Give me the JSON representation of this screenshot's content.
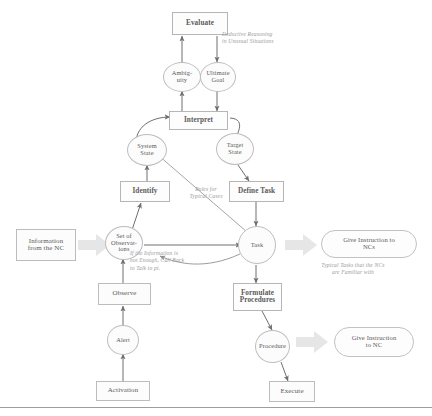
{
  "figure": {
    "colors": {
      "node_stroke": "#bdbdbd",
      "node_fill": "#fcfcfc",
      "text": "#5a5a5a",
      "caption_text": "#9a9a9a",
      "thin_arrow": "#6f6f6f",
      "block_arrow": "#e2e2e2",
      "rule": "#9d9d9d"
    }
  },
  "nodes": {
    "evaluate": {
      "label": "Evaluate",
      "shape": "box"
    },
    "ambiguity": {
      "label": "Ambig-\nuity",
      "shape": "circle"
    },
    "ultimate_goal": {
      "label": "Ultimate\nGoal",
      "shape": "circle"
    },
    "interpret": {
      "label": "Interpret",
      "shape": "box"
    },
    "system_state": {
      "label": "System\nState",
      "shape": "circle"
    },
    "target_state": {
      "label": "Target\nState",
      "shape": "circle"
    },
    "identify": {
      "label": "Identify",
      "shape": "box"
    },
    "define_task": {
      "label": "Define Task",
      "shape": "box"
    },
    "information_from_nc": {
      "label": "Information\nfrom the NC",
      "shape": "plainbox"
    },
    "set_of_observations": {
      "label": "Set of\nObservat-\nions",
      "shape": "circle"
    },
    "task": {
      "label": "Task",
      "shape": "circle"
    },
    "give_instruction_to_ncs": {
      "label": "Give Instruction to\nNCs",
      "shape": "pill"
    },
    "observe": {
      "label": "Observe",
      "shape": "plainbox"
    },
    "formulate_procedures": {
      "label": "Formulate\nProcedures",
      "shape": "box"
    },
    "alert": {
      "label": "Alert",
      "shape": "circle"
    },
    "procedure": {
      "label": "Procedure",
      "shape": "circle"
    },
    "give_instruction_to_nc": {
      "label": "Give Instruction\nto NC",
      "shape": "pill"
    },
    "activation": {
      "label": "Activation",
      "shape": "plainbox"
    },
    "execute": {
      "label": "Execute",
      "shape": "plainbox"
    }
  },
  "captions": {
    "deductive_reasoning": "Deductive Reasoning\nin Unusual Situations",
    "rules_for_typical_cases": "Rules for\nTypical Cases",
    "call_back": "If the Information is\nnot Enough, Call Back\nto Talk to pt.",
    "typical_tasks": "Typical Tasks that the NCs\nare Familiar with"
  },
  "edges": [
    {
      "from": "ambiguity",
      "to": "evaluate",
      "style": "thin-arrow"
    },
    {
      "from": "evaluate",
      "to": "ultimate_goal",
      "style": "thin-arrow"
    },
    {
      "from": "interpret",
      "to": "ambiguity",
      "style": "thin-arrow"
    },
    {
      "from": "ultimate_goal",
      "to": "interpret",
      "style": "thin-arrow"
    },
    {
      "from": "system_state",
      "to": "interpret",
      "style": "curved-arrow"
    },
    {
      "from": "interpret",
      "to": "target_state",
      "style": "curved-arrow"
    },
    {
      "from": "identify",
      "to": "system_state",
      "style": "thin-arrow"
    },
    {
      "from": "target_state",
      "to": "define_task",
      "style": "thin-arrow"
    },
    {
      "from": "system_state",
      "to": "task",
      "style": "thin-line"
    },
    {
      "from": "set_of_observations",
      "to": "identify",
      "style": "thin-arrow"
    },
    {
      "from": "information_from_nc",
      "to": "set_of_observations",
      "style": "block-arrow"
    },
    {
      "from": "define_task",
      "to": "task",
      "style": "thin-arrow"
    },
    {
      "from": "set_of_observations",
      "to": "task",
      "style": "thin-arrow"
    },
    {
      "from": "task",
      "to": "give_instruction_to_ncs",
      "style": "block-arrow"
    },
    {
      "from": "observe",
      "to": "set_of_observations",
      "style": "thin-arrow"
    },
    {
      "from": "task",
      "to": "set_of_observations",
      "style": "curved-arrow"
    },
    {
      "from": "task",
      "to": "formulate_procedures",
      "style": "thin-arrow"
    },
    {
      "from": "alert",
      "to": "observe",
      "style": "thin-arrow"
    },
    {
      "from": "formulate_procedures",
      "to": "procedure",
      "style": "thin-arrow"
    },
    {
      "from": "procedure",
      "to": "give_instruction_to_nc",
      "style": "block-arrow"
    },
    {
      "from": "activation",
      "to": "alert",
      "style": "thin-arrow"
    },
    {
      "from": "procedure",
      "to": "execute",
      "style": "thin-arrow"
    }
  ]
}
